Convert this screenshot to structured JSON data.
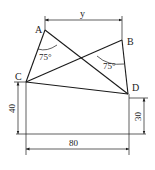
{
  "diagram": {
    "points": {
      "A": {
        "label": "A",
        "x": 45,
        "y": 30
      },
      "B": {
        "label": "B",
        "x": 122,
        "y": 40
      },
      "C": {
        "label": "C",
        "x": 26,
        "y": 82
      },
      "D": {
        "label": "D",
        "x": 128,
        "y": 94
      }
    },
    "angles": [
      {
        "at": "A",
        "label": "75°"
      },
      {
        "at": "B",
        "label": "75°"
      }
    ],
    "dimensions": {
      "top": "y",
      "left": "40",
      "right": "30",
      "bottom": "80"
    },
    "colors": {
      "stroke": "#1a1a1a",
      "background": "#ffffff"
    }
  }
}
